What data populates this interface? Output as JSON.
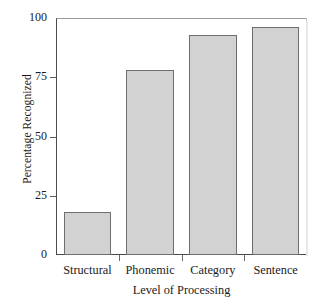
{
  "chart_data": {
    "type": "bar",
    "title": "",
    "subtitle": "",
    "xlabel": "Level of Processing",
    "ylabel": "Percentage Recognized",
    "categories": [
      "Structural",
      "Phonemic",
      "Category",
      "Sentence"
    ],
    "values": [
      18,
      78,
      93,
      96
    ],
    "series": [
      {
        "name": "Percentage Recognized",
        "values": [
          18,
          78,
          93,
          96
        ]
      }
    ],
    "ylim": [
      0,
      100
    ],
    "yticks": [
      0,
      25,
      50,
      75,
      100
    ],
    "ytick_labels": [
      "0",
      "25",
      "50",
      "75",
      "100"
    ],
    "grid": false,
    "legend": false,
    "legend_position": "none",
    "bar_fill_color": "#d2d2d2",
    "bar_edge_color": "#6e6e6e",
    "axis_color": "#4a4a4a",
    "background_color": "#ffffff",
    "text_color": "#1b1b1b"
  },
  "axes": {
    "y_title": "Percentage Recognized",
    "x_title": "Level of Processing",
    "y_tick_labels": [
      "100",
      "75",
      "50",
      "25",
      "0"
    ],
    "x_tick_labels": [
      "Structural",
      "Phonemic",
      "Category",
      "Sentence"
    ]
  }
}
